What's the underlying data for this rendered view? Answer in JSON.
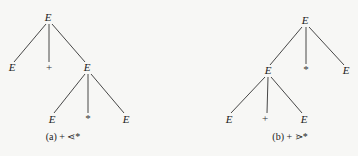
{
  "diagram": {
    "type": "parse-trees",
    "trees": [
      {
        "id": "a",
        "caption": "(a) + ⋖*",
        "caption_pos": [
          63,
          140
        ],
        "nodes": [
          {
            "id": "a0",
            "label": "E",
            "x": 48,
            "y": 21,
            "italic": true
          },
          {
            "id": "a1",
            "label": "E",
            "x": 12,
            "y": 71,
            "italic": true
          },
          {
            "id": "a2",
            "label": "+",
            "x": 49,
            "y": 71,
            "italic": false
          },
          {
            "id": "a3",
            "label": "E",
            "x": 87,
            "y": 71,
            "italic": true
          },
          {
            "id": "a4",
            "label": "E",
            "x": 52,
            "y": 123,
            "italic": true
          },
          {
            "id": "a5",
            "label": "*",
            "x": 88,
            "y": 122,
            "italic": false
          },
          {
            "id": "a6",
            "label": "E",
            "x": 126,
            "y": 123,
            "italic": true
          }
        ],
        "edges": [
          {
            "from": [
              46,
              24
            ],
            "to": [
              14,
              62
            ]
          },
          {
            "from": [
              49,
              24
            ],
            "to": [
              49,
              62
            ]
          },
          {
            "from": [
              52,
              24
            ],
            "to": [
              85,
              62
            ]
          },
          {
            "from": [
              85,
              74
            ],
            "to": [
              54,
              113
            ]
          },
          {
            "from": [
              88,
              74
            ],
            "to": [
              88,
              113
            ]
          },
          {
            "from": [
              91,
              74
            ],
            "to": [
              124,
              113
            ]
          }
        ]
      },
      {
        "id": "b",
        "caption": "(b) + ⋗*",
        "caption_pos": [
          290,
          140
        ],
        "nodes": [
          {
            "id": "b0",
            "label": "E",
            "x": 305,
            "y": 24,
            "italic": true
          },
          {
            "id": "b1",
            "label": "E",
            "x": 268,
            "y": 74,
            "italic": true
          },
          {
            "id": "b2",
            "label": "*",
            "x": 306,
            "y": 73,
            "italic": false
          },
          {
            "id": "b3",
            "label": "E",
            "x": 346,
            "y": 74,
            "italic": true
          },
          {
            "id": "b4",
            "label": "E",
            "x": 229,
            "y": 123,
            "italic": true
          },
          {
            "id": "b5",
            "label": "+",
            "x": 265,
            "y": 122,
            "italic": false
          },
          {
            "id": "b6",
            "label": "E",
            "x": 304,
            "y": 123,
            "italic": true
          }
        ],
        "edges": [
          {
            "from": [
              302,
              27
            ],
            "to": [
              270,
              65
            ]
          },
          {
            "from": [
              306,
              27
            ],
            "to": [
              306,
              64
            ]
          },
          {
            "from": [
              309,
              27
            ],
            "to": [
              344,
              65
            ]
          },
          {
            "from": [
              265,
              77
            ],
            "to": [
              231,
              113
            ]
          },
          {
            "from": [
              268,
              77
            ],
            "to": [
              267,
              113
            ]
          },
          {
            "from": [
              271,
              77
            ],
            "to": [
              302,
              113
            ]
          }
        ]
      }
    ]
  }
}
